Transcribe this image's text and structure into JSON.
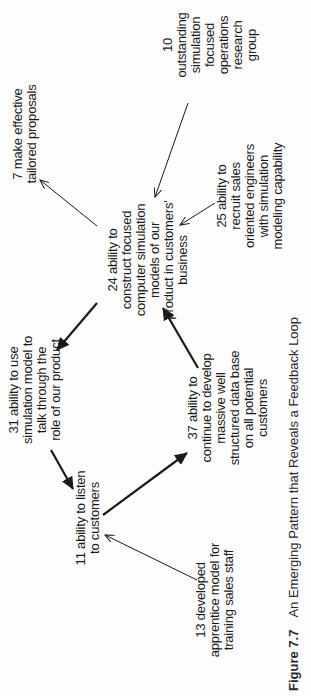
{
  "diagram": {
    "orientation": "rotated-90-ccw",
    "nodes": [
      {
        "id": "n10",
        "number": "10",
        "text": "10 outstanding\nsimulation focused\noperations research\ngroup"
      },
      {
        "id": "n7",
        "number": "7",
        "text": "7 make effective\ntailored proposals"
      },
      {
        "id": "n25",
        "number": "25",
        "text": "25 ability to\nrecruit sales\noriented engineers\nwith simulation\nmodeling capability"
      },
      {
        "id": "n24",
        "number": "24",
        "text": "24 ability to\nconstruct focused\ncomputer simulation\nmodels of our\nproduct in customers'\nbusiness"
      },
      {
        "id": "n31",
        "number": "31",
        "text": "31 ability to use\nsimulation model to\ntalk through the\nrole of our product"
      },
      {
        "id": "n37",
        "number": "37",
        "text": "37 ability to\ncontinue to develop\nmassive well\nstructured data base\non all potential\ncustomers"
      },
      {
        "id": "n11",
        "number": "11",
        "text": "11 ability to listen\nto customers"
      },
      {
        "id": "n13",
        "number": "13",
        "text": "13 developed\napprentice model for\ntraining sales staff"
      }
    ],
    "links": [
      {
        "from": "10",
        "to": "24",
        "style": "thin"
      },
      {
        "from": "25",
        "to": "24",
        "style": "thin"
      },
      {
        "from": "24",
        "to": "7",
        "style": "thin"
      },
      {
        "from": "24",
        "to": "31",
        "style": "bold"
      },
      {
        "from": "37",
        "to": "24",
        "style": "bold"
      },
      {
        "from": "31",
        "to": "11",
        "style": "bold"
      },
      {
        "from": "11",
        "to": "37",
        "style": "bold"
      },
      {
        "from": "13",
        "to": "11",
        "style": "thin"
      }
    ],
    "colors": {
      "ink": "#1a1a1a",
      "background": "#fdfdfd"
    }
  },
  "caption": {
    "figure_number": "Figure 7.7",
    "title": "An Emerging Pattern that Reveals a Feedback Loop"
  }
}
